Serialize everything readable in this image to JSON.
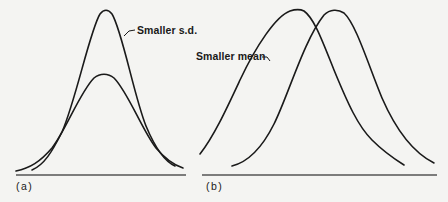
{
  "figure": {
    "panels": [
      {
        "id": "a",
        "label": "(a)",
        "annotation": "Smaller s.d.",
        "description": "Two normal curves with the same mean; the taller, narrower curve has the smaller standard deviation"
      },
      {
        "id": "b",
        "label": "(b)",
        "annotation": "Smaller mean",
        "description": "Two normal curves with the same standard deviation; the left curve has the smaller mean"
      }
    ]
  },
  "colors": {
    "background": "#f4f4f2",
    "stroke": "#1a1a1a",
    "axis": "#555555"
  }
}
